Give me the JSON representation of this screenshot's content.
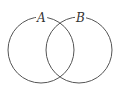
{
  "diagram": {
    "type": "venn",
    "sets": [
      {
        "label": "A",
        "cx": 41,
        "cy": 50,
        "r": 33
      },
      {
        "label": "B",
        "cx": 79,
        "cy": 50,
        "r": 33
      }
    ],
    "stroke_color": "#555555"
  }
}
